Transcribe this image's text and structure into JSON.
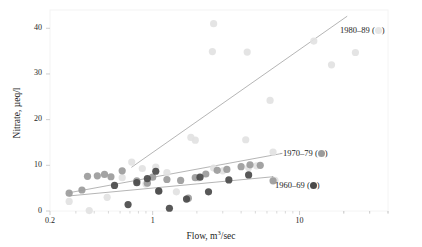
{
  "chart_data": {
    "type": "scatter",
    "title": "",
    "xlabel": "Flow, m3/sec",
    "ylabel": "Nitrate, µeq/l",
    "xscale": "log",
    "xlim": [
      0.2,
      40
    ],
    "ylim": [
      0,
      44
    ],
    "xticks": [
      0.2,
      1,
      10
    ],
    "xtick_labels": [
      "0.2",
      "1",
      "10"
    ],
    "yticks": [
      0,
      10,
      20,
      30,
      40
    ],
    "ytick_labels": [
      "0",
      "10",
      "20",
      "30",
      "40"
    ],
    "grid": false,
    "legend_position": "right-inside",
    "series": [
      {
        "name": "1980-89",
        "label": "1980–89",
        "color": "#e2e2e2",
        "points": [
          [
            2.6,
            41.0
          ],
          [
            2.55,
            34.9
          ],
          [
            4.4,
            34.8
          ],
          [
            12.5,
            37.2
          ],
          [
            16.5,
            32.0
          ],
          [
            24.0,
            34.7
          ],
          [
            6.3,
            24.2
          ],
          [
            1.95,
            15.5
          ],
          [
            1.82,
            16.1
          ],
          [
            4.3,
            15.6
          ],
          [
            6.6,
            12.9
          ],
          [
            0.72,
            10.7
          ],
          [
            1.05,
            9.6
          ],
          [
            0.85,
            9.3
          ],
          [
            2.6,
            9.4
          ],
          [
            3.0,
            8.8
          ],
          [
            4.5,
            9.5
          ],
          [
            5.1,
            9.9
          ],
          [
            1.25,
            8.4
          ],
          [
            0.62,
            7.3
          ],
          [
            0.49,
            3.0
          ],
          [
            0.37,
            0.1
          ],
          [
            0.27,
            2.1
          ],
          [
            1.45,
            4.2
          ],
          [
            2.05,
            7.2
          ],
          [
            6.8,
            6.7
          ],
          [
            0.9,
            5.9
          ]
        ],
        "trend": {
          "x1": 0.72,
          "y1": 9.6,
          "x2": 21.0,
          "y2": 42.6
        }
      },
      {
        "name": "1970-79",
        "label": "1970–79",
        "color": "#9b9b9b",
        "points": [
          [
            0.36,
            7.6
          ],
          [
            0.42,
            7.7
          ],
          [
            0.47,
            8.0
          ],
          [
            0.52,
            7.5
          ],
          [
            0.62,
            8.8
          ],
          [
            0.78,
            6.6
          ],
          [
            0.92,
            6.1
          ],
          [
            1.0,
            7.4
          ],
          [
            1.25,
            6.9
          ],
          [
            1.55,
            6.7
          ],
          [
            1.95,
            7.3
          ],
          [
            2.3,
            8.1
          ],
          [
            2.75,
            8.9
          ],
          [
            3.2,
            9.1
          ],
          [
            4.0,
            9.7
          ],
          [
            4.6,
            10.1
          ],
          [
            5.4,
            10.0
          ],
          [
            6.6,
            6.6
          ],
          [
            0.27,
            3.9
          ],
          [
            0.33,
            4.6
          ],
          [
            1.1,
            4.3
          ],
          [
            1.75,
            2.8
          ]
        ],
        "trend": {
          "x1": 0.27,
          "y1": 4.0,
          "x2": 7.6,
          "y2": 12.6
        }
      },
      {
        "name": "1960-69",
        "label": "1960–69",
        "color": "#4a4a4a",
        "points": [
          [
            0.55,
            5.6
          ],
          [
            0.68,
            1.4
          ],
          [
            0.92,
            7.1
          ],
          [
            1.05,
            8.7
          ],
          [
            1.1,
            4.4
          ],
          [
            1.3,
            0.6
          ],
          [
            1.7,
            2.6
          ],
          [
            2.1,
            7.4
          ],
          [
            2.4,
            4.2
          ],
          [
            3.3,
            6.8
          ],
          [
            4.5,
            7.9
          ],
          [
            0.78,
            6.2
          ]
        ],
        "trend": {
          "x1": 0.27,
          "y1": 3.3,
          "x2": 6.6,
          "y2": 7.5
        }
      }
    ]
  },
  "legend": [
    {
      "label": "1980–89",
      "color": "#e6e6e6",
      "x": 340,
      "y": 25
    },
    {
      "label": "1970–79",
      "color": "#9b9b9b",
      "x": 283,
      "y": 148
    },
    {
      "label": "1960–69",
      "color": "#4a4a4a",
      "x": 275,
      "y": 180
    }
  ],
  "frame": {
    "border_color": "#f2f2f2",
    "background": "#ffffff"
  }
}
